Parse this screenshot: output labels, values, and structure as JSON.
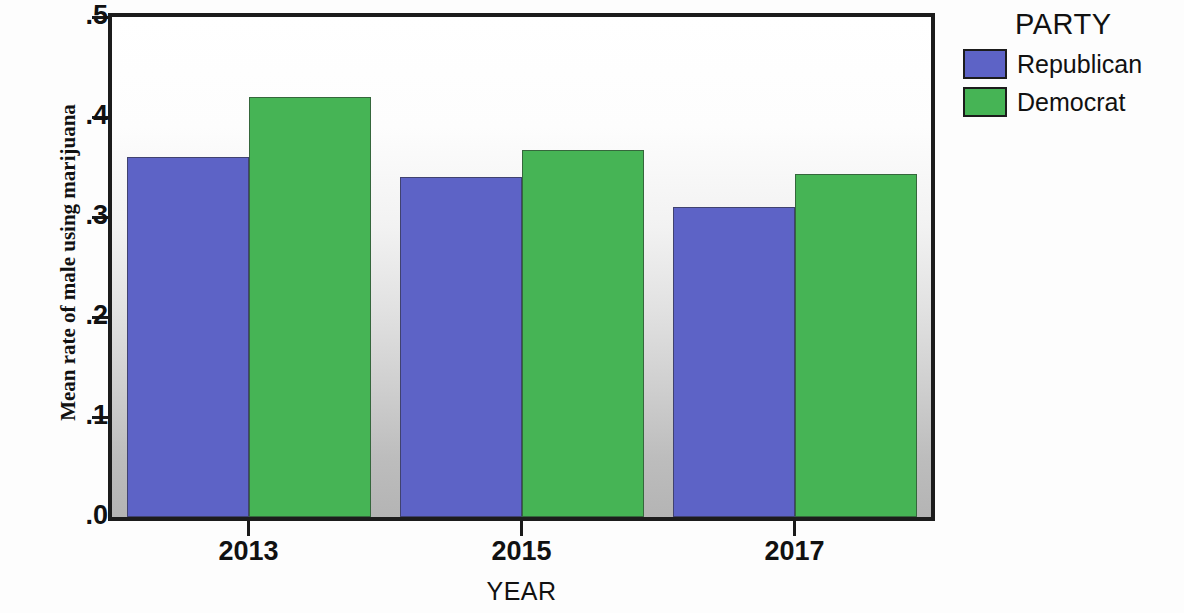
{
  "chart_data": {
    "type": "bar",
    "title": "",
    "xlabel": "YEAR",
    "ylabel": "Mean rate of male using marijuana",
    "categories": [
      "2013",
      "2015",
      "2017"
    ],
    "series": [
      {
        "name": "Republican",
        "color": "#5d63c6",
        "values": [
          0.36,
          0.34,
          0.31
        ]
      },
      {
        "name": "Democrat",
        "color": "#46b455",
        "values": [
          0.42,
          0.367,
          0.343
        ]
      }
    ],
    "ylim": [
      0.0,
      0.5
    ],
    "yticks": [
      ".5",
      ".4",
      ".3",
      ".2",
      ".1",
      ".0"
    ],
    "ytick_values": [
      0.5,
      0.4,
      0.3,
      0.2,
      0.1,
      0.0
    ],
    "grid": false,
    "legend_position": "right",
    "legend_title": "PARTY"
  },
  "axes": {
    "y_title": "Mean rate of male using marijuana",
    "x_title": "YEAR"
  },
  "legend": {
    "title": "PARTY",
    "entries": [
      {
        "label": "Republican",
        "color": "#5d63c6"
      },
      {
        "label": "Democrat",
        "color": "#46b455"
      }
    ]
  }
}
